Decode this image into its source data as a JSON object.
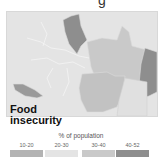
{
  "header": {
    "cropped_title_fragment": "g"
  },
  "map": {
    "title_line1": "Food",
    "title_line2": "insecurity",
    "regions": [
      {
        "id": "region-north-central",
        "category": "40-52"
      },
      {
        "id": "region-northeast",
        "category": "30-40"
      },
      {
        "id": "region-east",
        "category": "40-52"
      },
      {
        "id": "region-southwest",
        "category": "40-52"
      },
      {
        "id": "region-south-central",
        "category": "30-40"
      },
      {
        "id": "region-west",
        "category": "20-30"
      },
      {
        "id": "region-southeast",
        "category": "20-30"
      }
    ]
  },
  "legend": {
    "title": "% of population",
    "items": [
      {
        "label": "10-20",
        "color": "#b3b3b3"
      },
      {
        "label": "20-30",
        "color": "#e4e4e4"
      },
      {
        "label": "30-40",
        "color": "#c9c9c9"
      },
      {
        "label": "40-52",
        "color": "#8e8e8e"
      }
    ]
  }
}
